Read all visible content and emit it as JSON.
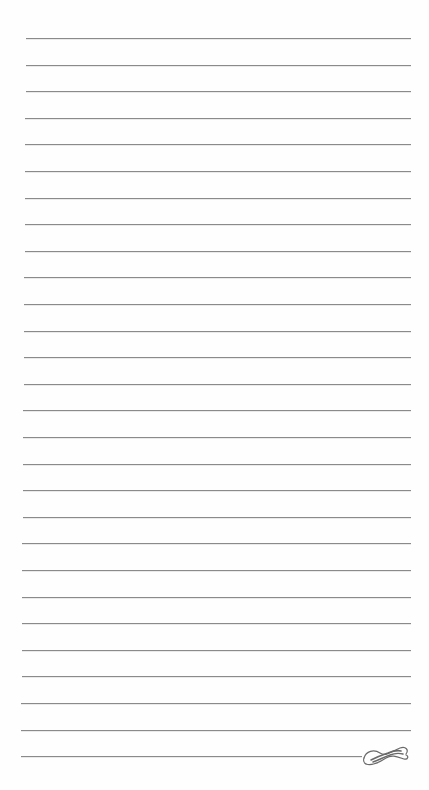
{
  "page": {
    "type": "lined-notepaper",
    "background": "#fefefe",
    "rule_color": "#8a8a8a",
    "line_count": 28,
    "first_line_y": 38,
    "line_spacing": 26.6,
    "line_left_top": 26,
    "line_left_bottom": 21,
    "line_right": 411,
    "last_line_right": 362
  },
  "ornament": {
    "icon": "flourish-icon",
    "position": "bottom-right, end of last line"
  }
}
